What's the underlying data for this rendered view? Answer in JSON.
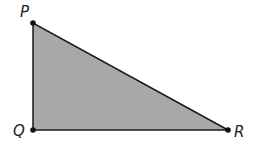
{
  "diagram": {
    "type": "right-triangle",
    "fill_color": "#a8a8a8",
    "stroke_color": "#1a1a1a",
    "vertices": [
      {
        "label": "P",
        "x": 33,
        "y": 23
      },
      {
        "label": "Q",
        "x": 33,
        "y": 130
      },
      {
        "label": "R",
        "x": 228,
        "y": 130
      }
    ],
    "right_angle_at": "Q"
  }
}
